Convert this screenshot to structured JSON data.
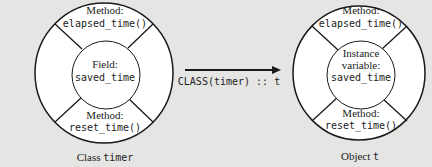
{
  "class_diagram": {
    "top_method": {
      "label": "Method:",
      "name": "elapsed_time()"
    },
    "center": {
      "label": "Field:",
      "name": "saved_time"
    },
    "bottom_method": {
      "label": "Method:",
      "name": "reset_time()"
    },
    "caption_prefix": "Class",
    "caption_name": "timer"
  },
  "arrow": {
    "label": "CLASS(timer) :: t"
  },
  "object_diagram": {
    "top_method": {
      "label": "Method:",
      "name": "elapsed_time()"
    },
    "center": {
      "label_line1": "Instance",
      "label_line2": "variable:",
      "name": "saved_time"
    },
    "bottom_method": {
      "label": "Method:",
      "name": "reset_time()"
    },
    "caption_prefix": "Object",
    "caption_name": "t"
  },
  "colors": {
    "background": "#e5e5e3",
    "stroke": "#1a1a1a",
    "fill": "#ffffff"
  }
}
